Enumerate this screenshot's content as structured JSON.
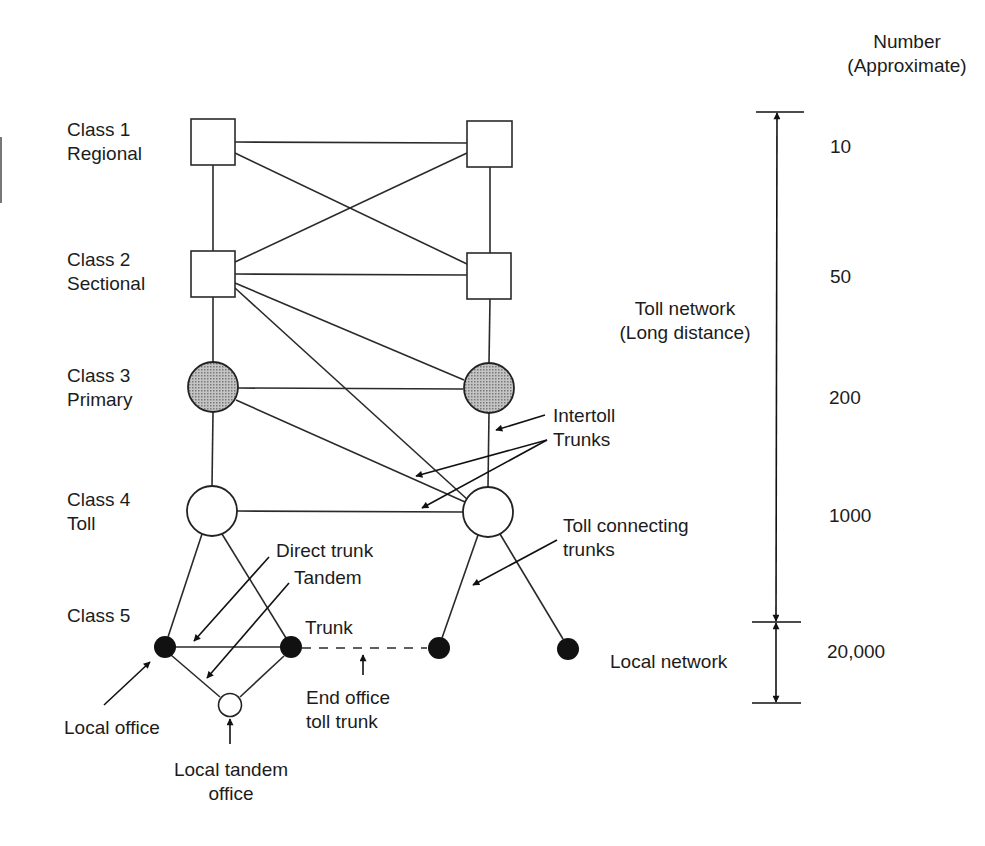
{
  "hierarchy": {
    "classes": [
      {
        "line1": "Class 1",
        "line2": "Regional",
        "count": "10",
        "shape": "square"
      },
      {
        "line1": "Class 2",
        "line2": "Sectional",
        "count": "50",
        "shape": "square"
      },
      {
        "line1": "Class 3",
        "line2": "Primary",
        "count": "200",
        "shape": "shaded-circle"
      },
      {
        "line1": "Class 4",
        "line2": "Toll",
        "count": "1000",
        "shape": "circle"
      },
      {
        "line1": "Class 5",
        "line2": "",
        "count": "20,000",
        "shape": "filled-dot"
      }
    ]
  },
  "header": {
    "number_line1": "Number",
    "number_line2": "(Approximate)"
  },
  "ranges": {
    "toll_line1": "Toll network",
    "toll_line2": "(Long distance)",
    "local": "Local network"
  },
  "annotations": {
    "intertoll_line1": "Intertoll",
    "intertoll_line2": "Trunks",
    "toll_connecting_line1": "Toll connecting",
    "toll_connecting_line2": "trunks",
    "direct_trunk": "Direct trunk",
    "tandem": "Tandem",
    "trunk": "Trunk",
    "end_office_line1": "End office",
    "end_office_line2": "toll trunk",
    "local_office": "Local office",
    "local_tandem_line1": "Local tandem",
    "local_tandem_line2": "office"
  },
  "colors": {
    "line": "#2a2a2a",
    "shaded_fill": "#a8a8a8",
    "dot_fill": "#111111"
  }
}
